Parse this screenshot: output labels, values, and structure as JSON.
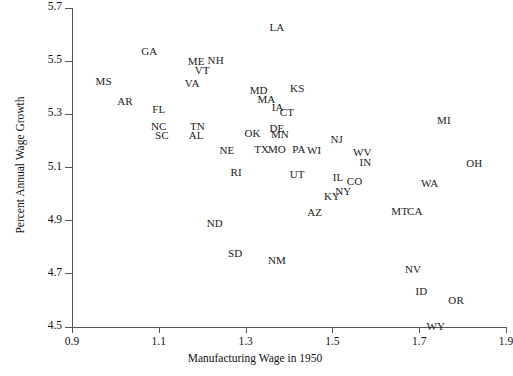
{
  "chart_data": {
    "type": "scatter",
    "title": "",
    "xlabel": "Manufacturing Wage in 1950",
    "ylabel": "Percent Annual Wage Growth",
    "xlim": [
      0.9,
      1.9
    ],
    "ylim": [
      4.5,
      5.7
    ],
    "xticks": [
      "0.9",
      "1.1",
      "1.3",
      "1.5",
      "1.7",
      "1.9"
    ],
    "xtick_values": [
      0.9,
      1.1,
      1.3,
      1.5,
      1.7,
      1.9
    ],
    "yticks": [
      "5.7",
      "5.5",
      "5.3",
      "5.1",
      "4.9",
      "4.7",
      "4.5"
    ],
    "ytick_values": [
      5.7,
      5.5,
      5.3,
      5.1,
      4.9,
      4.7,
      4.5
    ],
    "grid": false,
    "legend": "none",
    "marker_style": "text-labels",
    "point_count": 48,
    "points": [
      {
        "label": "LA",
        "x": 1.372,
        "y": 5.627
      },
      {
        "label": "GA",
        "x": 1.078,
        "y": 5.538
      },
      {
        "label": "NH",
        "x": 1.231,
        "y": 5.506
      },
      {
        "label": "ME",
        "x": 1.186,
        "y": 5.502
      },
      {
        "label": "VT",
        "x": 1.2,
        "y": 5.466
      },
      {
        "label": "MS",
        "x": 0.973,
        "y": 5.427
      },
      {
        "label": "VA",
        "x": 1.177,
        "y": 5.419
      },
      {
        "label": "AR",
        "x": 1.022,
        "y": 5.352
      },
      {
        "label": "FL",
        "x": 1.1,
        "y": 5.32
      },
      {
        "label": "KS",
        "x": 1.419,
        "y": 5.399
      },
      {
        "label": "MD",
        "x": 1.33,
        "y": 5.391
      },
      {
        "label": "MA",
        "x": 1.348,
        "y": 5.356
      },
      {
        "label": "IA",
        "x": 1.374,
        "y": 5.328
      },
      {
        "label": "CT",
        "x": 1.395,
        "y": 5.308
      },
      {
        "label": "NC",
        "x": 1.1,
        "y": 5.256
      },
      {
        "label": "TN",
        "x": 1.189,
        "y": 5.256
      },
      {
        "label": "SC",
        "x": 1.107,
        "y": 5.221
      },
      {
        "label": "AL",
        "x": 1.186,
        "y": 5.221
      },
      {
        "label": "MI",
        "x": 1.757,
        "y": 5.28
      },
      {
        "label": "DE",
        "x": 1.372,
        "y": 5.248
      },
      {
        "label": "MN",
        "x": 1.379,
        "y": 5.225
      },
      {
        "label": "OK",
        "x": 1.316,
        "y": 5.229
      },
      {
        "label": "NJ",
        "x": 1.51,
        "y": 5.209
      },
      {
        "label": "TX",
        "x": 1.337,
        "y": 5.17
      },
      {
        "label": "MO",
        "x": 1.372,
        "y": 5.17
      },
      {
        "label": "PA",
        "x": 1.423,
        "y": 5.17
      },
      {
        "label": "WI",
        "x": 1.458,
        "y": 5.166
      },
      {
        "label": "WV",
        "x": 1.569,
        "y": 5.158
      },
      {
        "label": "NE",
        "x": 1.257,
        "y": 5.166
      },
      {
        "label": "IN",
        "x": 1.576,
        "y": 5.122
      },
      {
        "label": "OH",
        "x": 1.827,
        "y": 5.118
      },
      {
        "label": "RI",
        "x": 1.278,
        "y": 5.083
      },
      {
        "label": "UT",
        "x": 1.419,
        "y": 5.075
      },
      {
        "label": "IL",
        "x": 1.513,
        "y": 5.063
      },
      {
        "label": "CO",
        "x": 1.551,
        "y": 5.051
      },
      {
        "label": "WA",
        "x": 1.724,
        "y": 5.043
      },
      {
        "label": "NY",
        "x": 1.525,
        "y": 5.012
      },
      {
        "label": "KY",
        "x": 1.499,
        "y": 4.992
      },
      {
        "label": "AZ",
        "x": 1.459,
        "y": 4.932
      },
      {
        "label": "MT",
        "x": 1.655,
        "y": 4.936
      },
      {
        "label": "CA",
        "x": 1.69,
        "y": 4.936
      },
      {
        "label": "ND",
        "x": 1.229,
        "y": 4.892
      },
      {
        "label": "SD",
        "x": 1.276,
        "y": 4.777
      },
      {
        "label": "NM",
        "x": 1.372,
        "y": 4.753
      },
      {
        "label": "NV",
        "x": 1.686,
        "y": 4.718
      },
      {
        "label": "ID",
        "x": 1.705,
        "y": 4.635
      },
      {
        "label": "OR",
        "x": 1.785,
        "y": 4.603
      },
      {
        "label": "WY",
        "x": 1.738,
        "y": 4.504
      }
    ]
  },
  "axes": {
    "x_axis_label": "Manufacturing Wage in 1950",
    "y_axis_label": "Percent Annual Wage Growth"
  }
}
